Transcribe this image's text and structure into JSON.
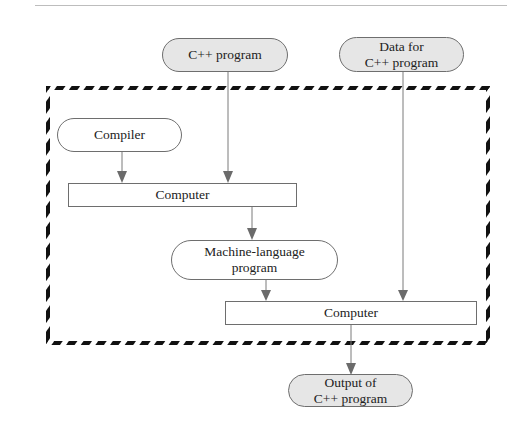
{
  "diagram": {
    "boundary": {
      "style": "thick slanted black dashed border"
    },
    "nodes": {
      "cpp_program": {
        "label": "C++ program",
        "shape": "rounded-pill",
        "fill": "#e6e6e6"
      },
      "data_for_cpp": {
        "label": "Data for\nC++ program",
        "shape": "rounded-pill",
        "fill": "#e6e6e6"
      },
      "compiler": {
        "label": "Compiler",
        "shape": "rounded-pill",
        "fill": "#ffffff"
      },
      "computer_1": {
        "label": "Computer",
        "shape": "rectangle",
        "fill": "#ffffff"
      },
      "machine_language": {
        "label": "Machine-language\nprogram",
        "shape": "rounded-pill",
        "fill": "#ffffff"
      },
      "computer_2": {
        "label": "Computer",
        "shape": "rectangle",
        "fill": "#ffffff"
      },
      "output": {
        "label": "Output of\nC++ program",
        "shape": "rounded-pill",
        "fill": "#e6e6e6"
      }
    },
    "edges": [
      {
        "from": "compiler",
        "to": "computer_1"
      },
      {
        "from": "cpp_program",
        "to": "computer_1"
      },
      {
        "from": "computer_1",
        "to": "machine_language"
      },
      {
        "from": "machine_language",
        "to": "computer_2"
      },
      {
        "from": "data_for_cpp",
        "to": "computer_2"
      },
      {
        "from": "computer_2",
        "to": "output"
      }
    ],
    "colors": {
      "line": "#7a7a7a",
      "arrowhead": "#6b6b6b",
      "border_dash": "#111111",
      "shaded_fill": "#e6e6e6"
    }
  }
}
